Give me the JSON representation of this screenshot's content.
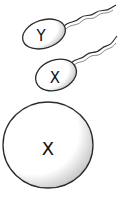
{
  "illustration": {
    "sperm_y": {
      "label": "Y"
    },
    "sperm_x": {
      "label": "X"
    },
    "egg": {
      "label": "X"
    }
  },
  "colors": {
    "outline": "#2a2a2a",
    "cell_fill": "#ffffff",
    "shade": "#cfcfcf",
    "label": "#111111"
  }
}
